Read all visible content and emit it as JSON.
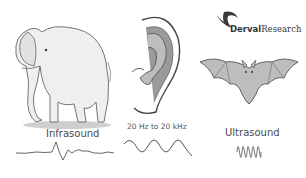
{
  "logo": {
    "brand_bold": "Derval",
    "brand_regular": "Research"
  },
  "panels": [
    {
      "id": "infrasound",
      "animal": "elephant",
      "label": "Infrasound",
      "wave": "irregular-low-frequency"
    },
    {
      "id": "audible",
      "animal": "human-ear",
      "label": "20 Hz to 20 kHz",
      "wave": "sine-3-cycles"
    },
    {
      "id": "ultrasound",
      "animal": "bat",
      "label": "Ultrasound",
      "wave": "high-frequency-compressed"
    }
  ],
  "colors": {
    "line": "#555555",
    "fill": "#bdbdbd",
    "shadow": "#999999",
    "text": "#4a4a4a"
  }
}
